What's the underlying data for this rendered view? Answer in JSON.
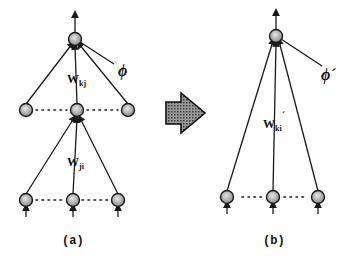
{
  "panels": {
    "a": {
      "caption": "(a)",
      "weight_hidden_output": "W",
      "weight_hidden_output_sub": "kj",
      "weight_input_hidden": "W",
      "weight_input_hidden_sub": "ji",
      "bias_label": "ϕ",
      "layers": [
        "input",
        "hidden",
        "output"
      ]
    },
    "b": {
      "caption": "(b)",
      "weight_input_output": "W",
      "weight_input_output_sub": "ki",
      "weight_prime": "´",
      "bias_label": "ϕ´",
      "layers": [
        "input",
        "output"
      ]
    }
  },
  "transform_arrow": {
    "direction": "right",
    "fill": "#6a6a6a"
  },
  "colors": {
    "ink": "#1a1a1a",
    "node_fill": "#c8c8c8",
    "background": "#ffffff"
  }
}
